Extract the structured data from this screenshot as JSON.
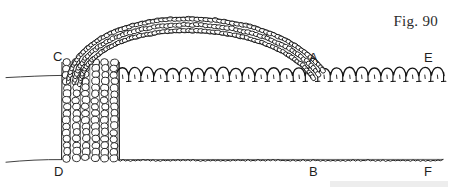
{
  "figure": {
    "caption": "Fig. 90",
    "background_color": "#ffffff",
    "ink_color": "#1a1a1a",
    "width": 450,
    "height": 189,
    "labels": [
      {
        "id": "C",
        "text": "C",
        "x": 57,
        "y": 57,
        "meaning": "top-left corner of column where upper row begins"
      },
      {
        "id": "A",
        "text": "A",
        "x": 313,
        "y": 58,
        "meaning": "point where arch meets the upper row"
      },
      {
        "id": "E",
        "text": "E",
        "x": 428,
        "y": 58,
        "meaning": "right end of upper row"
      },
      {
        "id": "D",
        "text": "D",
        "x": 58,
        "y": 172,
        "meaning": "bottom-left corner of column at foundation row"
      },
      {
        "id": "B",
        "text": "B",
        "x": 313,
        "y": 172,
        "meaning": "point on foundation row below A"
      },
      {
        "id": "F",
        "text": "F",
        "x": 428,
        "y": 172,
        "meaning": "right end of foundation row"
      }
    ],
    "elements": {
      "arch_band": {
        "name": "crocheted arch of oval stitch loops",
        "rows": 3,
        "start_point": "C",
        "end_point": "A",
        "apex_y": 12
      },
      "column_block": {
        "name": "vertical block of stitch columns",
        "left_x": 62,
        "right_x": 119,
        "top_y": 60,
        "bottom_y": 160,
        "column_count": 6
      },
      "upper_row": {
        "name": "row of chain-arch stitches from C to E",
        "from": "C",
        "to": "E",
        "baseline_y": 76,
        "scallop_count": 26
      },
      "foundation_row": {
        "name": "wavy foundation chain from D to F",
        "from": "D",
        "to": "F",
        "baseline_y": 160
      },
      "left_guide_lines": {
        "name": "thin guide lines extending to left margin",
        "upper_y": 76,
        "lower_y": 160
      }
    }
  }
}
